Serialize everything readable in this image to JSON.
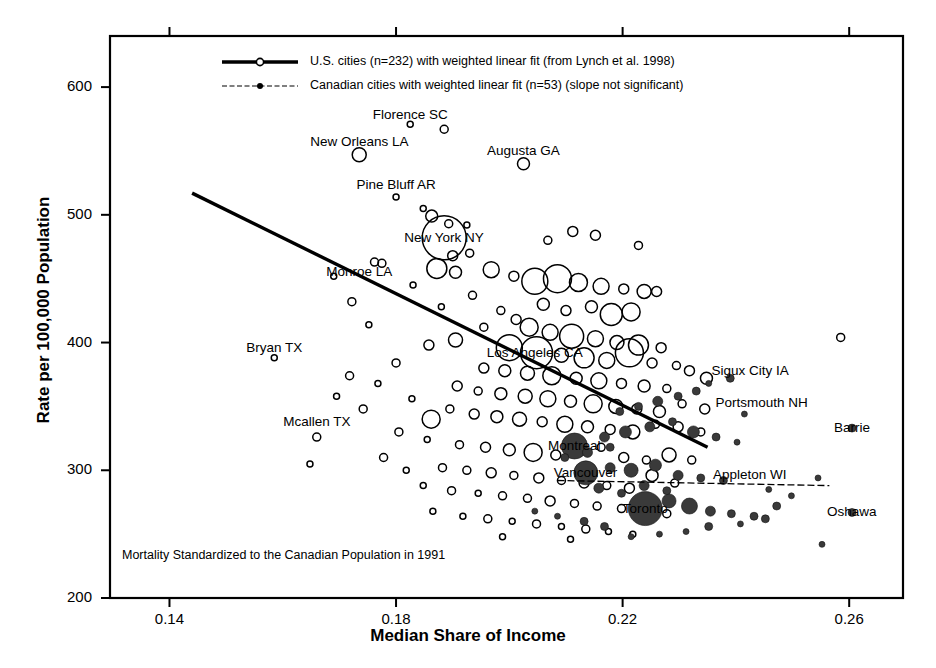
{
  "figure": {
    "title": "",
    "footnote": "Mortality Standardized to the Canadian Population in 1991"
  },
  "axes": {
    "x": {
      "label": "Median Share of Income",
      "ticks": [
        "0.14",
        "0.18",
        "0.22",
        "0.26"
      ],
      "tick_values": [
        0.14,
        0.18,
        0.22,
        0.26
      ],
      "range": [
        0.1295,
        0.2695
      ]
    },
    "y": {
      "label": "Rate per 100,000 Population",
      "ticks": [
        "200",
        "300",
        "400",
        "500",
        "600"
      ],
      "tick_values": [
        200,
        300,
        400,
        500,
        600
      ],
      "range": [
        200,
        640
      ]
    }
  },
  "legend": {
    "entries": [
      {
        "marker": "open-circle",
        "line": "solid-thick",
        "label": "U.S. cities (n=232) with weighted linear fit (from Lynch et al. 1998)"
      },
      {
        "marker": "filled-circle",
        "line": "dotted-thin",
        "label": "Canadian cities with weighted linear fit (n=53) (slope not significant)"
      }
    ]
  },
  "annotations": [
    {
      "text": "Florence SC",
      "x": 0.1825,
      "y": 578,
      "anchor": "middle"
    },
    {
      "text": "New Orleans LA",
      "x": 0.1735,
      "y": 557,
      "anchor": "middle"
    },
    {
      "text": "Augusta GA",
      "x": 0.2025,
      "y": 550,
      "anchor": "middle"
    },
    {
      "text": "Pine Bluff AR",
      "x": 0.18,
      "y": 523,
      "anchor": "middle"
    },
    {
      "text": "New York NY",
      "x": 0.1885,
      "y": 482,
      "anchor": "middle"
    },
    {
      "text": "Monroe LA",
      "x": 0.1735,
      "y": 455,
      "anchor": "middle"
    },
    {
      "text": "Bryan TX",
      "x": 0.1585,
      "y": 396,
      "anchor": "middle"
    },
    {
      "text": "Los Angeles CA",
      "x": 0.2045,
      "y": 392,
      "anchor": "middle"
    },
    {
      "text": "Mcallen TX",
      "x": 0.166,
      "y": 338,
      "anchor": "middle"
    },
    {
      "text": "Sigux City IA",
      "x": 0.2425,
      "y": 378,
      "anchor": "middle"
    },
    {
      "text": "Portsmouth NH",
      "x": 0.2445,
      "y": 353,
      "anchor": "middle"
    },
    {
      "text": "Barrie",
      "x": 0.2605,
      "y": 333,
      "anchor": "middle"
    },
    {
      "text": "Montreal",
      "x": 0.2115,
      "y": 319,
      "anchor": "middle"
    },
    {
      "text": "Vancouver",
      "x": 0.2135,
      "y": 298,
      "anchor": "middle"
    },
    {
      "text": "Appleton WI",
      "x": 0.2425,
      "y": 296,
      "anchor": "middle"
    },
    {
      "text": "Toronto",
      "x": 0.224,
      "y": 270,
      "anchor": "middle"
    },
    {
      "text": "Oshawa",
      "x": 0.2605,
      "y": 267,
      "anchor": "middle"
    }
  ],
  "chart_data": {
    "type": "scatter",
    "title": "",
    "xlabel": "Median Share of Income",
    "ylabel": "Rate per 100,000 Population",
    "xlim": [
      0.1295,
      0.2695
    ],
    "ylim": [
      200,
      640
    ],
    "grid": false,
    "legend_position": "top-center",
    "note": "Bubble scatter; marker radius encodes city population. Open circles = U.S. cities, filled circles = Canadian cities.",
    "series": [
      {
        "name": "U.S. cities (n=232) with weighted linear fit (from Lynch et al. 1998)",
        "marker": "open-circle",
        "color": "#000000",
        "n": 232,
        "points": [
          [
            0.1825,
            571,
            3
          ],
          [
            0.1885,
            567,
            4
          ],
          [
            0.1735,
            547,
            7
          ],
          [
            0.2025,
            540,
            6
          ],
          [
            0.18,
            514,
            3
          ],
          [
            0.1848,
            505,
            3
          ],
          [
            0.1863,
            499,
            6
          ],
          [
            0.1893,
            493,
            4
          ],
          [
            0.1925,
            492,
            3
          ],
          [
            0.2112,
            487,
            5
          ],
          [
            0.2152,
            484,
            5
          ],
          [
            0.2068,
            480,
            4
          ],
          [
            0.1885,
            482,
            22
          ],
          [
            0.19,
            468,
            5
          ],
          [
            0.193,
            470,
            4
          ],
          [
            0.2228,
            476,
            4
          ],
          [
            0.1762,
            463,
            4
          ],
          [
            0.1775,
            462,
            4
          ],
          [
            0.1872,
            458,
            10
          ],
          [
            0.1905,
            455,
            6
          ],
          [
            0.1968,
            457,
            8
          ],
          [
            0.2008,
            452,
            5
          ],
          [
            0.2045,
            448,
            13
          ],
          [
            0.2085,
            450,
            14
          ],
          [
            0.2122,
            447,
            9
          ],
          [
            0.2162,
            444,
            8
          ],
          [
            0.2202,
            442,
            5
          ],
          [
            0.2238,
            440,
            7
          ],
          [
            0.183,
            445,
            3
          ],
          [
            0.169,
            452,
            3
          ],
          [
            0.1722,
            432,
            4
          ],
          [
            0.1935,
            437,
            4
          ],
          [
            0.188,
            428,
            3
          ],
          [
            0.206,
            430,
            6
          ],
          [
            0.21,
            425,
            5
          ],
          [
            0.2145,
            428,
            6
          ],
          [
            0.218,
            422,
            11
          ],
          [
            0.2215,
            424,
            9
          ],
          [
            0.226,
            440,
            5
          ],
          [
            0.1985,
            425,
            4
          ],
          [
            0.2012,
            418,
            5
          ],
          [
            0.1752,
            414,
            3
          ],
          [
            0.1955,
            412,
            4
          ],
          [
            0.2035,
            412,
            9
          ],
          [
            0.2072,
            408,
            8
          ],
          [
            0.211,
            405,
            12
          ],
          [
            0.2152,
            403,
            8
          ],
          [
            0.219,
            400,
            7
          ],
          [
            0.2228,
            398,
            10
          ],
          [
            0.2268,
            396,
            5
          ],
          [
            0.2585,
            404,
            4
          ],
          [
            0.1905,
            402,
            7
          ],
          [
            0.1858,
            398,
            5
          ],
          [
            0.2,
            396,
            13
          ],
          [
            0.2048,
            392,
            16
          ],
          [
            0.2092,
            390,
            7
          ],
          [
            0.2132,
            388,
            10
          ],
          [
            0.2172,
            386,
            8
          ],
          [
            0.2212,
            392,
            14
          ],
          [
            0.2252,
            384,
            5
          ],
          [
            0.2295,
            382,
            4
          ],
          [
            0.1585,
            388,
            3
          ],
          [
            0.18,
            384,
            4
          ],
          [
            0.1955,
            380,
            5
          ],
          [
            0.1992,
            378,
            6
          ],
          [
            0.2032,
            376,
            7
          ],
          [
            0.2075,
            374,
            9
          ],
          [
            0.2118,
            372,
            6
          ],
          [
            0.2158,
            370,
            8
          ],
          [
            0.2198,
            368,
            5
          ],
          [
            0.2238,
            366,
            6
          ],
          [
            0.2278,
            364,
            4
          ],
          [
            0.2318,
            378,
            5
          ],
          [
            0.2348,
            372,
            6
          ],
          [
            0.1718,
            374,
            4
          ],
          [
            0.1768,
            368,
            3
          ],
          [
            0.1908,
            366,
            5
          ],
          [
            0.1945,
            362,
            4
          ],
          [
            0.1985,
            360,
            6
          ],
          [
            0.2028,
            358,
            7
          ],
          [
            0.2068,
            356,
            8
          ],
          [
            0.2108,
            354,
            6
          ],
          [
            0.2148,
            352,
            9
          ],
          [
            0.2188,
            350,
            7
          ],
          [
            0.2225,
            348,
            5
          ],
          [
            0.2265,
            346,
            6
          ],
          [
            0.2305,
            352,
            4
          ],
          [
            0.2345,
            348,
            5
          ],
          [
            0.1862,
            340,
            9
          ],
          [
            0.1742,
            348,
            4
          ],
          [
            0.1695,
            358,
            3
          ],
          [
            0.1828,
            356,
            3
          ],
          [
            0.1895,
            348,
            4
          ],
          [
            0.1938,
            344,
            5
          ],
          [
            0.1978,
            342,
            6
          ],
          [
            0.2018,
            340,
            7
          ],
          [
            0.2058,
            338,
            5
          ],
          [
            0.2098,
            336,
            8
          ],
          [
            0.2138,
            334,
            6
          ],
          [
            0.2178,
            332,
            5
          ],
          [
            0.2218,
            330,
            7
          ],
          [
            0.2258,
            336,
            4
          ],
          [
            0.2298,
            334,
            5
          ],
          [
            0.2338,
            330,
            4
          ],
          [
            0.166,
            326,
            4
          ],
          [
            0.1805,
            330,
            4
          ],
          [
            0.1855,
            324,
            3
          ],
          [
            0.1912,
            320,
            4
          ],
          [
            0.1958,
            318,
            5
          ],
          [
            0.2,
            316,
            6
          ],
          [
            0.2042,
            314,
            9
          ],
          [
            0.2082,
            312,
            5
          ],
          [
            0.2122,
            322,
            6
          ],
          [
            0.2162,
            318,
            4
          ],
          [
            0.2202,
            310,
            5
          ],
          [
            0.2242,
            308,
            4
          ],
          [
            0.2282,
            312,
            7
          ],
          [
            0.2322,
            308,
            4
          ],
          [
            0.1648,
            305,
            3
          ],
          [
            0.1778,
            310,
            4
          ],
          [
            0.1818,
            300,
            3
          ],
          [
            0.1882,
            302,
            4
          ],
          [
            0.1925,
            300,
            4
          ],
          [
            0.1968,
            298,
            5
          ],
          [
            0.2008,
            296,
            4
          ],
          [
            0.2052,
            294,
            5
          ],
          [
            0.2092,
            292,
            4
          ],
          [
            0.2132,
            290,
            5
          ],
          [
            0.2172,
            288,
            4
          ],
          [
            0.2212,
            286,
            5
          ],
          [
            0.2252,
            296,
            6
          ],
          [
            0.2292,
            290,
            4
          ],
          [
            0.1848,
            288,
            3
          ],
          [
            0.1898,
            284,
            4
          ],
          [
            0.1945,
            282,
            3
          ],
          [
            0.1988,
            280,
            4
          ],
          [
            0.2032,
            278,
            4
          ],
          [
            0.2072,
            276,
            5
          ],
          [
            0.2115,
            274,
            4
          ],
          [
            0.2155,
            272,
            4
          ],
          [
            0.2198,
            270,
            4
          ],
          [
            0.2238,
            268,
            4
          ],
          [
            0.2278,
            266,
            4
          ],
          [
            0.1865,
            268,
            3
          ],
          [
            0.1918,
            264,
            3
          ],
          [
            0.1962,
            262,
            4
          ],
          [
            0.2005,
            260,
            3
          ],
          [
            0.2048,
            258,
            4
          ],
          [
            0.2092,
            256,
            3
          ],
          [
            0.2135,
            254,
            4
          ],
          [
            0.2175,
            252,
            3
          ],
          [
            0.2218,
            250,
            3
          ],
          [
            0.1988,
            248,
            3
          ],
          [
            0.2108,
            246,
            3
          ]
        ]
      },
      {
        "name": "Canadian cities with weighted linear fit (n=53) (slope not significant)",
        "marker": "filled-circle",
        "color": "#3a3a3a",
        "n": 53,
        "points": [
          [
            0.239,
            372,
            4
          ],
          [
            0.2352,
            368,
            3
          ],
          [
            0.233,
            362,
            4
          ],
          [
            0.2298,
            358,
            4
          ],
          [
            0.2262,
            354,
            5
          ],
          [
            0.2228,
            350,
            4
          ],
          [
            0.2195,
            346,
            4
          ],
          [
            0.2415,
            344,
            3
          ],
          [
            0.2115,
            319,
            13
          ],
          [
            0.2168,
            326,
            5
          ],
          [
            0.2205,
            330,
            6
          ],
          [
            0.2248,
            334,
            5
          ],
          [
            0.2288,
            338,
            4
          ],
          [
            0.2325,
            330,
            6
          ],
          [
            0.2365,
            326,
            4
          ],
          [
            0.2402,
            322,
            3
          ],
          [
            0.2135,
            298,
            12
          ],
          [
            0.2178,
            302,
            5
          ],
          [
            0.2215,
            300,
            7
          ],
          [
            0.2258,
            304,
            6
          ],
          [
            0.2298,
            296,
            5
          ],
          [
            0.2338,
            294,
            4
          ],
          [
            0.2378,
            292,
            4
          ],
          [
            0.2605,
            333,
            4
          ],
          [
            0.224,
            270,
            17
          ],
          [
            0.2282,
            276,
            7
          ],
          [
            0.2318,
            272,
            8
          ],
          [
            0.2355,
            268,
            5
          ],
          [
            0.2392,
            266,
            4
          ],
          [
            0.2432,
            264,
            4
          ],
          [
            0.2472,
            272,
            4
          ],
          [
            0.2605,
            267,
            4
          ],
          [
            0.2158,
            286,
            5
          ],
          [
            0.2198,
            282,
            4
          ],
          [
            0.2238,
            288,
            5
          ],
          [
            0.2278,
            284,
            4
          ],
          [
            0.2098,
            310,
            4
          ],
          [
            0.2138,
            314,
            5
          ],
          [
            0.2178,
            318,
            4
          ],
          [
            0.2458,
            285,
            3
          ],
          [
            0.2498,
            280,
            3
          ],
          [
            0.2545,
            294,
            3
          ],
          [
            0.2352,
            256,
            4
          ],
          [
            0.2408,
            258,
            3
          ],
          [
            0.2452,
            262,
            4
          ],
          [
            0.2312,
            252,
            3
          ],
          [
            0.2265,
            250,
            3
          ],
          [
            0.2215,
            248,
            3
          ],
          [
            0.2168,
            256,
            4
          ],
          [
            0.2132,
            260,
            4
          ],
          [
            0.2085,
            264,
            3
          ],
          [
            0.2045,
            268,
            3
          ],
          [
            0.2552,
            242,
            3
          ]
        ]
      }
    ],
    "fits": [
      {
        "name": "U.S. weighted linear fit",
        "style": "solid-thick",
        "x0": 0.144,
        "y0": 517,
        "x1": 0.235,
        "y1": 318
      },
      {
        "name": "Canadian weighted linear fit (slope not significant)",
        "style": "dotted-thin",
        "x0": 0.2085,
        "y0": 292,
        "x1": 0.2565,
        "y1": 288
      }
    ]
  }
}
